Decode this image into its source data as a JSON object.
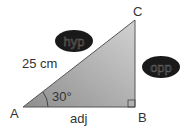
{
  "diagram": {
    "type": "right-triangle",
    "vertices": {
      "A": {
        "label": "A"
      },
      "B": {
        "label": "B"
      },
      "C": {
        "label": "C"
      }
    },
    "hypotenuse_length": "25 cm",
    "angle_A": "30°",
    "adjacent_label": "adj",
    "hyp_oval_label": "hyp",
    "opp_oval_label": "opp",
    "colors": {
      "triangle_fill_dark": "#8f8f8f",
      "triangle_fill_light": "#cfcfcf",
      "stroke": "#555555",
      "oval_fill": "#1a1a1a",
      "text": "#333333"
    }
  }
}
